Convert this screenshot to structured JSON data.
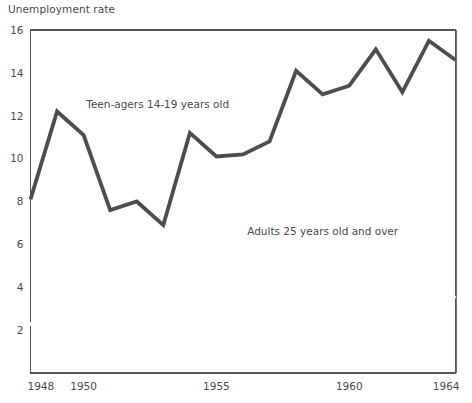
{
  "chart_data": {
    "type": "line",
    "title": "Unemployment rate",
    "xlabel": "",
    "ylabel": "",
    "x": [
      1948,
      1949,
      1950,
      1951,
      1952,
      1953,
      1954,
      1955,
      1956,
      1957,
      1958,
      1959,
      1960,
      1961,
      1962,
      1963,
      1964
    ],
    "xlim": [
      1948,
      1964
    ],
    "ylim": [
      0,
      16
    ],
    "yticks": [
      2,
      4,
      6,
      8,
      10,
      12,
      14,
      16
    ],
    "ytick_labels": [
      "2",
      "4",
      "6",
      "8",
      "10",
      "12",
      "14",
      "16"
    ],
    "xticks": [
      1948,
      1950,
      1955,
      1960,
      1964
    ],
    "xtick_labels": [
      "1948",
      "1950",
      "1955",
      "1960",
      "1964"
    ],
    "grid": true,
    "grid_x_every": 1,
    "legend_position": "inline-annotations",
    "series": [
      {
        "name": "Teen-agers 14-19 years old",
        "style": "thick dark line with gray fill below",
        "color": "#4d4d4d",
        "fill_color": "#b0b0b0",
        "values": [
          8.1,
          12.2,
          11.1,
          7.6,
          8.0,
          6.9,
          11.2,
          10.1,
          10.2,
          10.8,
          14.1,
          13.0,
          13.4,
          15.1,
          13.1,
          15.5,
          14.6
        ]
      },
      {
        "name": "Adults 25 years old and over",
        "style": "thick white line",
        "color": "#ffffff",
        "values": [
          2.2,
          4.4,
          4.0,
          2.6,
          2.3,
          2.3,
          4.4,
          3.6,
          3.2,
          3.3,
          5.5,
          4.2,
          4.0,
          4.9,
          4.1,
          4.0,
          3.5
        ]
      }
    ],
    "annotations": [
      {
        "text": "Teen-agers 14-19 years old",
        "x": 1950.1,
        "y": 12.35,
        "anchor": "start"
      },
      {
        "text": "Adults 25 years old and over",
        "x": 1959.0,
        "y": 6.45,
        "anchor": "middle"
      }
    ],
    "colors": {
      "plot_background": "#ffffff",
      "area_fill": "#b0b0b0",
      "teen_line": "#4d4d4d",
      "adult_line": "#ffffff",
      "gridline": "#6e6e6e",
      "axis_line": "#555555",
      "text": "#4a4a4a"
    }
  }
}
